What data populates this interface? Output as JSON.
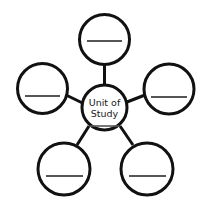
{
  "diagram": {
    "type": "concept-web",
    "title_text": "Unit of Study",
    "center": {
      "name": "center-node",
      "line1": "Unit of",
      "line2": "Study",
      "cx": 104.5,
      "cy": 107.5,
      "r": 22.5,
      "stroke_width": 3,
      "has_write_line": true,
      "write_line": {
        "x1": 90,
        "x2": 119,
        "y": 126
      }
    },
    "colors": {
      "background": "#ffffff",
      "outline": "#111111",
      "write_line": "#555555",
      "text": "#1a1a1a"
    },
    "outer_nodes": [
      {
        "name": "node-top",
        "position": "top",
        "label": "",
        "cx": 104.5,
        "cy": 39.5,
        "r": 25,
        "stroke_width": 3,
        "write_line": {
          "x1": 87,
          "x2": 122,
          "y": 41
        }
      },
      {
        "name": "node-left",
        "position": "left",
        "label": "",
        "cx": 42.5,
        "cy": 88.5,
        "r": 25,
        "stroke_width": 3,
        "write_line": {
          "x1": 25,
          "x2": 60,
          "y": 96
        }
      },
      {
        "name": "node-right",
        "position": "right",
        "label": "",
        "cx": 169,
        "cy": 89,
        "r": 25,
        "stroke_width": 3,
        "write_line": {
          "x1": 151,
          "x2": 187,
          "y": 97
        }
      },
      {
        "name": "node-bottom-left",
        "position": "bottom-left",
        "label": "",
        "cx": 64,
        "cy": 169,
        "r": 26,
        "stroke_width": 3,
        "write_line": {
          "x1": 46,
          "x2": 83,
          "y": 176
        }
      },
      {
        "name": "node-bottom-right",
        "position": "bottom-right",
        "label": "",
        "cx": 147,
        "cy": 169,
        "r": 26,
        "stroke_width": 3,
        "write_line": {
          "x1": 129,
          "x2": 166,
          "y": 176
        }
      }
    ],
    "spokes": [
      {
        "name": "spoke-center-top",
        "x1": 104.5,
        "y1": 85,
        "x2": 104.5,
        "y2": 64,
        "width": 3
      },
      {
        "name": "spoke-center-left",
        "x1": 82.5,
        "y1": 103,
        "x2": 66,
        "y2": 95,
        "width": 3
      },
      {
        "name": "spoke-center-right",
        "x1": 127,
        "y1": 102,
        "x2": 145,
        "y2": 95,
        "width": 3
      },
      {
        "name": "spoke-center-bottom-left",
        "x1": 89,
        "y1": 126,
        "x2": 77,
        "y2": 145,
        "width": 3
      },
      {
        "name": "spoke-center-bottom-right",
        "x1": 120,
        "y1": 126,
        "x2": 133,
        "y2": 145,
        "width": 3
      }
    ]
  }
}
